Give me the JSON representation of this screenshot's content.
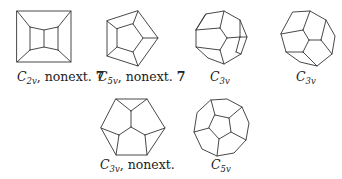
{
  "graphs": [
    {
      "id": "g1",
      "symmetry": "C",
      "sub": "2v",
      "suffix": ", nonext. ",
      "number": "7",
      "label_x": 17,
      "label_y": 69
    },
    {
      "id": "g2",
      "symmetry": "C",
      "sub": "5v",
      "suffix": ", nonext. ",
      "number": "7",
      "label_x": 98,
      "label_y": 69
    },
    {
      "id": "g3",
      "symmetry": "C",
      "sub": "3v",
      "suffix": "",
      "number": "",
      "label_x": 210,
      "label_y": 69
    },
    {
      "id": "g4",
      "symmetry": "C",
      "sub": "3v",
      "suffix": "",
      "number": "",
      "label_x": 296,
      "label_y": 69
    },
    {
      "id": "g5",
      "symmetry": "C",
      "sub": "3v",
      "suffix": ", nonext.",
      "number": "",
      "label_x": 110,
      "label_y": 155
    },
    {
      "id": "g6",
      "symmetry": "C",
      "sub": "5v",
      "suffix": "",
      "number": "",
      "label_x": 213,
      "label_y": 155
    }
  ],
  "colors": {
    "edge": "#333333",
    "text": "#222222",
    "background": "#ffffff"
  }
}
